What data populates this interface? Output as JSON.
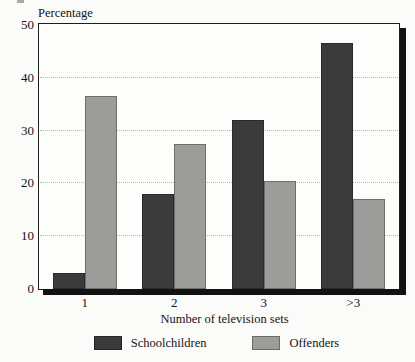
{
  "chart_data": {
    "type": "bar",
    "title": "",
    "subtitle": "",
    "xlabel": "Number of television sets",
    "ylabel": "Percentage",
    "categories": [
      "1",
      "2",
      "3",
      ">3"
    ],
    "series": [
      {
        "name": "Schoolchildren",
        "color": "#3b3b3b",
        "values": [
          3,
          18,
          32,
          46.5
        ]
      },
      {
        "name": "Offenders",
        "color": "#9c9c9a",
        "values": [
          36.5,
          27.5,
          20.5,
          17
        ]
      }
    ],
    "ylim": [
      0,
      50
    ],
    "yticks": [
      0,
      10,
      20,
      30,
      40,
      50
    ],
    "ytick_labels": [
      "0",
      "10",
      "20",
      "30",
      "40",
      "50"
    ],
    "grid": "horizontal-dotted",
    "legend_position": "bottom-center",
    "bar_grouping": "grouped-adjacent"
  },
  "axes": {
    "y_title": "Percentage",
    "x_title": "Number of television sets"
  },
  "legend": {
    "items": [
      {
        "label": "Schoolchildren",
        "color": "#3b3b3b"
      },
      {
        "label": "Offenders",
        "color": "#9c9c9a"
      }
    ]
  },
  "colors": {
    "series_schoolchildren": "#3b3b3b",
    "series_offenders": "#9c9c9a",
    "frame": "#1d1d1d",
    "gridline": "#b9b9b4",
    "background": "#fbfbfa",
    "text": "#141414"
  }
}
